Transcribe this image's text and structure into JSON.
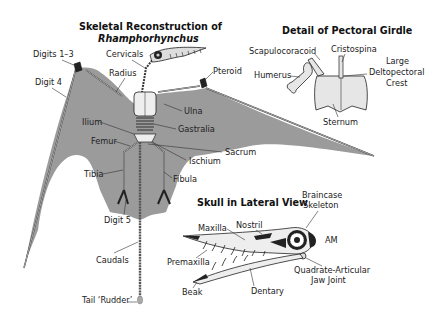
{
  "colors": {
    "membrane": "#9b9b9b",
    "bone": "#e6e6e6",
    "outline": "#222222",
    "text": "#222222"
  },
  "main_figure": {
    "title_line1": "Skeletal Reconstruction of",
    "title_line2": "Rhamphorhynchus",
    "labels": {
      "digits_1_3": "Digits 1–3",
      "digit_4": "Digit 4",
      "cervicals": "Cervicals",
      "radius": "Radius",
      "pteroid": "Pteroid",
      "ulna": "Ulna",
      "ilium": "Ilium",
      "gastralia": "Gastralia",
      "femur": "Femur",
      "sacrum": "Sacrum",
      "ischium": "Ischium",
      "tibia": "Tibia",
      "fibula": "Fibula",
      "digit_5": "Digit 5",
      "caudals": "Caudals",
      "tail_rudder": "Tail ‘Rudder’"
    }
  },
  "pectoral_detail": {
    "title": "Detail of Pectoral Girdle",
    "labels": {
      "scapulocoracoid": "Scapulocoracoid",
      "cristospina": "Cristospina",
      "humerus": "Humerus",
      "deltopectoral_1": "Large",
      "deltopectoral_2": "Deltopectoral",
      "deltopectoral_3": "Crest",
      "sternum": "Sternum"
    }
  },
  "skull_detail": {
    "title": "Skull in Lateral View",
    "labels": {
      "braincase_1": "Braincase",
      "braincase_2": "Skeleton",
      "nostril": "Nostril",
      "maxilla": "Maxilla",
      "am": "AM",
      "premaxilla": "Premaxilla",
      "quadrate_1": "Quadrate-Articular",
      "quadrate_2": "Jaw Joint",
      "beak": "Beak",
      "dentary": "Dentary"
    }
  }
}
